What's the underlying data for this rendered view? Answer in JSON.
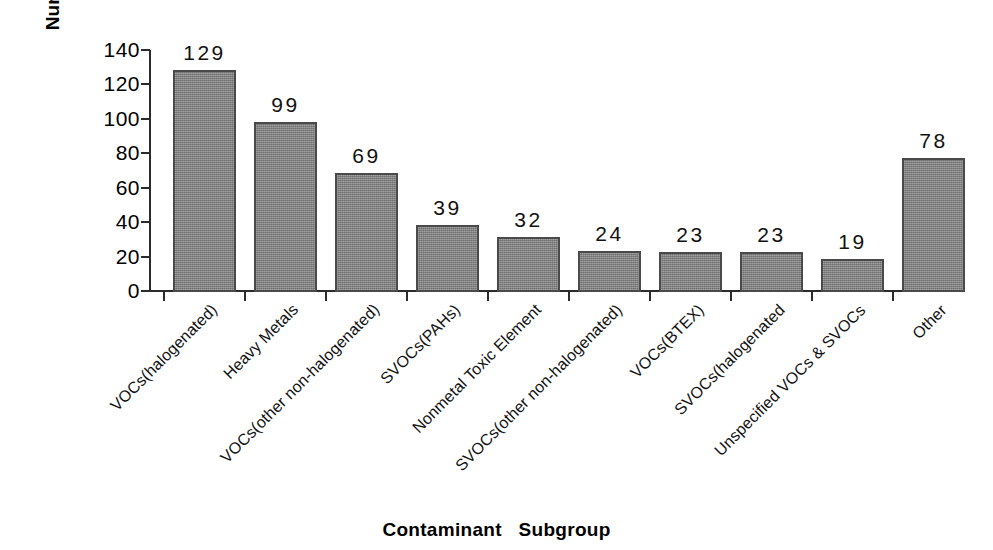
{
  "chart_data": {
    "type": "bar",
    "title": "",
    "xlabel": "Contaminant   Subgroup",
    "ylabel": "Number of Sites",
    "ylim": [
      0,
      140
    ],
    "ytick_step": 20,
    "yticks": [
      "140",
      "120",
      "100",
      "80",
      "60",
      "40",
      "20",
      "0"
    ],
    "grid": false,
    "legend": false,
    "orientation": "vertical",
    "categories": [
      "VOCs(halogenated)",
      "Heavy Metals",
      "VOCs(other non-halogenated)",
      "SVOCs(PAHs)",
      "Nonmetal Toxic Element",
      "SVOCs(other non-halogenated)",
      "VOCs(BTEX)",
      "SVOCs(halogenated",
      "Unspecified VOCs & SVOCs",
      "Other"
    ],
    "values": [
      129,
      99,
      69,
      39,
      32,
      24,
      23,
      23,
      19,
      78
    ],
    "value_labels": [
      "129",
      "99",
      "69",
      "39",
      "32",
      "24",
      "23",
      "23",
      "19",
      "78"
    ],
    "bar_color": "#858585",
    "bar_border_color": "#4a4a4a",
    "axis_color": "#2b2b2b",
    "background_color": "#ffffff",
    "text_color": "#111111"
  }
}
